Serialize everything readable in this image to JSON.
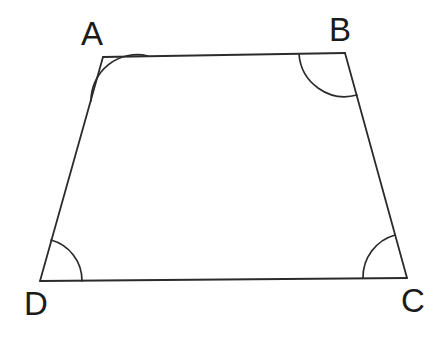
{
  "figure": {
    "kind": "geometry-diagram",
    "shape_name": "trapezoid",
    "background_color": "#ffffff",
    "stroke_color": "#2b2b2b",
    "label_color": "#1b1b1b",
    "stroke_width": 1.8,
    "canvas": {
      "width": 446,
      "height": 352
    },
    "vertices": [
      {
        "id": "A",
        "label": "A",
        "x": 103,
        "y": 57,
        "label_x": 81,
        "label_y": 17
      },
      {
        "id": "B",
        "label": "B",
        "x": 345,
        "y": 53,
        "label_x": 329,
        "label_y": 13
      },
      {
        "id": "C",
        "label": "C",
        "x": 407,
        "y": 278,
        "label_x": 401,
        "label_y": 284
      },
      {
        "id": "D",
        "label": "D",
        "x": 40,
        "y": 281,
        "label_x": 24,
        "label_y": 287
      }
    ],
    "edges": [
      {
        "id": "AB",
        "from": "A",
        "to": "B",
        "path": "M 103 57 L 345 53"
      },
      {
        "id": "BC",
        "from": "B",
        "to": "C",
        "path": "M 345 53 L 407 278"
      },
      {
        "id": "CD",
        "from": "C",
        "to": "D",
        "path": "M 407 278 L 40 281"
      },
      {
        "id": "DA",
        "from": "D",
        "to": "A",
        "path": "M 40 281 L 103 57"
      }
    ],
    "angle_arcs": [
      {
        "id": "angle-A",
        "at_vertex": "A",
        "radius": 46,
        "path": "M 148 56 A 46 46 0 0 0 91 101"
      },
      {
        "id": "angle-B",
        "at_vertex": "B",
        "radius": 46,
        "path": "M 299 54 A 46 46 0 0 0 357 95"
      },
      {
        "id": "angle-C",
        "at_vertex": "C",
        "radius": 44,
        "path": "M 363 278 A 44 44 0 0 1 395 235"
      },
      {
        "id": "angle-D",
        "at_vertex": "D",
        "radius": 42,
        "path": "M 82 281 A 42 42 0 0 0 51 240"
      }
    ]
  }
}
